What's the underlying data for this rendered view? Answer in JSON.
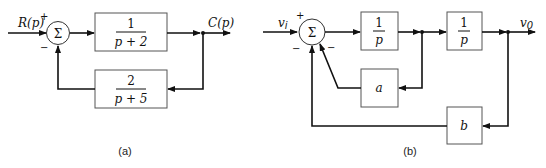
{
  "diagram_a": {
    "caption": "(a)",
    "input_label": "R(p)",
    "output_label": "C(p)",
    "sum_symbol": "Σ",
    "sign_plus": "+",
    "sign_minus": "−",
    "forward_block": {
      "numerator": "1",
      "denominator": "p + 2"
    },
    "feedback_block": {
      "numerator": "2",
      "denominator": "p + 5"
    }
  },
  "diagram_b": {
    "caption": "(b)",
    "input_label": "v",
    "input_subscript": "i",
    "output_label": "v",
    "output_subscript": "0",
    "sum_symbol": "Σ",
    "sign_plus": "+",
    "sign_minus_left": "−",
    "sign_minus_right": "−",
    "block1": {
      "numerator": "1",
      "denominator": "p"
    },
    "block2": {
      "numerator": "1",
      "denominator": "p"
    },
    "feedback_a": "a",
    "feedback_b": "b"
  }
}
